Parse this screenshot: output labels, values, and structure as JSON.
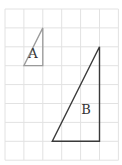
{
  "grid": {
    "origin_x": 5,
    "origin_y": 9,
    "cell": 18.9,
    "cols": 6,
    "rows": 8,
    "line_color": "#e2e2e2"
  },
  "triangles": [
    {
      "label": "A",
      "points_grid": [
        [
          2,
          1
        ],
        [
          2,
          3
        ],
        [
          1,
          3
        ]
      ],
      "label_pos": [
        33,
        58
      ],
      "stroke": "#9a9a9a",
      "stroke_width": 1.3
    },
    {
      "label": "B",
      "points_grid": [
        [
          5,
          2
        ],
        [
          5,
          7
        ],
        [
          2.5,
          7
        ]
      ],
      "label_pos": [
        86,
        114
      ],
      "stroke": "#3a3a3a",
      "stroke_width": 1.4
    }
  ]
}
